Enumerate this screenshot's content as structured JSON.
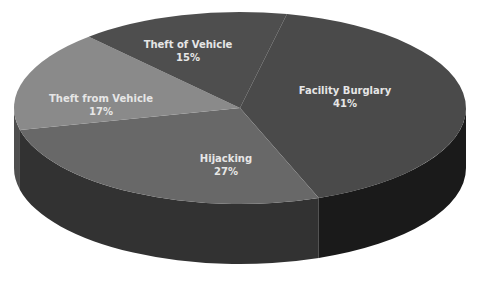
{
  "chart_data": {
    "type": "pie",
    "style": "3d",
    "title": "",
    "categories": [
      "Facility Burglary",
      "Hijacking",
      "Theft from Vehicle",
      "Theft of Vehicle"
    ],
    "values": [
      41,
      27,
      17,
      15
    ],
    "unit": "%",
    "legend": "none",
    "data_labels": [
      "Facility Burglary\n41%",
      "Hijacking\n27%",
      "Theft from Vehicle\n17%",
      "Theft of Vehicle\n15%"
    ]
  },
  "slices": [
    {
      "name": "Facility Burglary",
      "pct": "41%",
      "top": "#4a4a4a",
      "side": "#1a1a1a",
      "label_x": 345,
      "label_y": 88
    },
    {
      "name": "Hijacking",
      "pct": "27%",
      "top": "#686868",
      "side": "#323232",
      "label_x": 226,
      "label_y": 155
    },
    {
      "name": "Theft from Vehicle",
      "pct": "17%",
      "top": "#8a8a8a",
      "side": "#4e4e4e",
      "label_x": 101,
      "label_y": 95
    },
    {
      "name": "Theft of Vehicle",
      "pct": "15%",
      "top": "#4e4e4e",
      "side": "#2a2a2a",
      "label_x": 187,
      "label_y": 42
    }
  ],
  "geometry": {
    "cx": 240,
    "cy": 108,
    "rx": 226,
    "ry": 96,
    "depth": 60,
    "start_deg": -78
  }
}
